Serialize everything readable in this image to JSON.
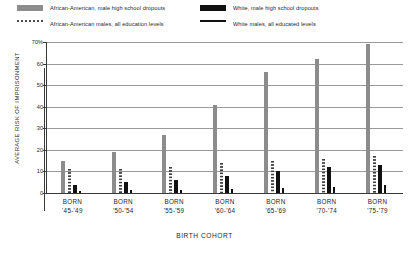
{
  "legend": {
    "items": [
      {
        "key": "aa_dropouts",
        "label": "African-American, male high school dropouts",
        "marker": "gray-bar-swatch",
        "color": "#8c8c8c"
      },
      {
        "key": "wh_dropouts",
        "label": "White, male high school dropouts",
        "marker": "black-bar-swatch",
        "color": "#111111"
      },
      {
        "key": "aa_all",
        "label": "African-American males, all education levels",
        "marker": "dotted-line-swatch",
        "color": "#4d4d4d"
      },
      {
        "key": "wh_all",
        "label": "White males, all educated levels",
        "marker": "solid-line-swatch",
        "color": "#111111"
      }
    ]
  },
  "axes": {
    "ylabel": "AVERAGE RISK OF IMPRISONMENT",
    "xlabel": "BIRTH COHORT",
    "yticks": [
      "70%",
      "60",
      "50",
      "40",
      "30",
      "20",
      "10",
      "0"
    ]
  },
  "categories_display": [
    {
      "line1": "BORN",
      "line2": "'45-'49"
    },
    {
      "line1": "BORN",
      "line2": "'50-'54"
    },
    {
      "line1": "BORN",
      "line2": "'55-'59"
    },
    {
      "line1": "BORN",
      "line2": "'60-'64"
    },
    {
      "line1": "BORN",
      "line2": "'65-'69"
    },
    {
      "line1": "BORN",
      "line2": "'70-'74"
    },
    {
      "line1": "BORN",
      "line2": "'75-'79"
    }
  ],
  "chart_data": {
    "type": "bar",
    "title": "",
    "xlabel": "BIRTH COHORT",
    "ylabel": "AVERAGE RISK OF IMPRISONMENT",
    "ylim": [
      0,
      70
    ],
    "yticks": [
      0,
      10,
      20,
      30,
      40,
      50,
      60,
      70
    ],
    "ytick_labels": [
      "0",
      "10",
      "20",
      "30",
      "40",
      "50",
      "60",
      "70%"
    ],
    "grid": true,
    "legend_position": "above-plot",
    "categories": [
      "BORN '45-'49",
      "BORN '50-'54",
      "BORN '55-'59",
      "BORN '60-'64",
      "BORN '65-'69",
      "BORN '70-'74",
      "BORN '75-'79"
    ],
    "series": [
      {
        "name": "African-American, male high school dropouts",
        "style": "bar",
        "color": "#8c8c8c",
        "values": [
          15,
          19,
          27,
          41,
          56,
          62,
          69
        ]
      },
      {
        "name": "African-American males, all education levels",
        "style": "dotted-bar",
        "color": "#4d4d4d",
        "values": [
          11,
          11,
          12,
          14,
          15,
          16,
          17
        ]
      },
      {
        "name": "White, male high school dropouts",
        "style": "bar",
        "color": "#111111",
        "values": [
          3.5,
          5,
          6,
          8,
          10,
          12,
          13
        ]
      },
      {
        "name": "White males, all educated levels",
        "style": "thin-bar",
        "color": "#111111",
        "values": [
          1,
          1.3,
          1.6,
          2,
          2.5,
          3,
          3.5
        ]
      }
    ]
  }
}
